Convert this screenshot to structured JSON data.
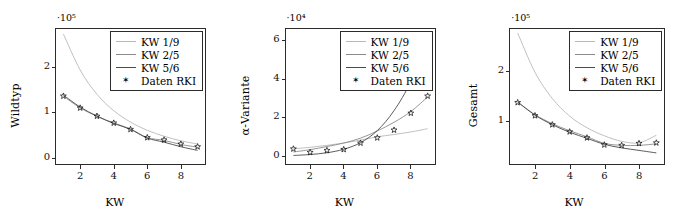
{
  "figure": {
    "panel_count": 3,
    "legend_entries": [
      {
        "label": "KW 1/9",
        "type": "line",
        "color": "#b9b9b9"
      },
      {
        "label": "KW 2/5",
        "type": "line",
        "color": "#8a8a8a"
      },
      {
        "label": "KW 5/6",
        "type": "line",
        "color": "#4a4a4a"
      },
      {
        "label": "Daten RKI",
        "type": "marker",
        "marker": "star-marker",
        "color": "#111111"
      }
    ]
  },
  "chart_data": [
    {
      "type": "line",
      "title": "",
      "xlabel": "KW",
      "ylabel": "Wildtyp",
      "y_exponent_label": "·10⁵",
      "y_exponent": 100000,
      "xlim": [
        0.5,
        9.5
      ],
      "ylim": [
        -0.15,
        2.85
      ],
      "xticks": [
        2,
        4,
        6,
        8
      ],
      "yticks": [
        0,
        1,
        2
      ],
      "grid": false,
      "legend_position": "top-right",
      "x": [
        1,
        2,
        3,
        4,
        5,
        6,
        7,
        8,
        9
      ],
      "series": [
        {
          "name": "KW 1/9",
          "color": "#b9b9b9",
          "values": [
            2.72,
            1.93,
            1.4,
            1.04,
            0.79,
            0.61,
            0.48,
            0.38,
            0.31
          ]
        },
        {
          "name": "KW 2/5",
          "color": "#8a8a8a",
          "values": [
            1.36,
            1.1,
            0.92,
            0.77,
            0.64,
            0.45,
            0.39,
            0.3,
            0.24
          ]
        },
        {
          "name": "KW 5/6",
          "color": "#4a4a4a",
          "values": [
            1.38,
            1.12,
            0.92,
            0.76,
            0.63,
            0.44,
            0.35,
            0.25,
            0.17
          ]
        }
      ],
      "markers": {
        "name": "Daten RKI",
        "x": [
          1,
          2,
          3,
          4,
          5,
          6,
          7,
          8,
          9
        ],
        "values": [
          1.36,
          1.1,
          0.92,
          0.77,
          0.63,
          0.45,
          0.4,
          0.31,
          0.25
        ]
      }
    },
    {
      "type": "line",
      "title": "",
      "xlabel": "KW",
      "ylabel": "α-Variante",
      "y_exponent_label": "·10⁴",
      "y_exponent": 10000,
      "xlim": [
        0.5,
        9.5
      ],
      "ylim": [
        -0.45,
        6.6
      ],
      "xticks": [
        2,
        4,
        6,
        8
      ],
      "yticks": [
        0,
        2,
        4,
        6
      ],
      "grid": false,
      "legend_position": "top-right",
      "x": [
        1,
        2,
        3,
        4,
        5,
        6,
        7,
        8,
        9
      ],
      "series": [
        {
          "name": "KW 1/9",
          "color": "#b9b9b9",
          "values": [
            0.38,
            0.46,
            0.56,
            0.68,
            0.83,
            1.0,
            1.12,
            1.25,
            1.42
          ]
        },
        {
          "name": "KW 2/5",
          "color": "#8a8a8a",
          "values": [
            0.22,
            0.34,
            0.5,
            0.68,
            0.93,
            1.3,
            1.75,
            2.3,
            3.05
          ]
        },
        {
          "name": "KW 5/6",
          "color": "#4a4a4a",
          "values": [
            0.04,
            0.09,
            0.18,
            0.36,
            0.7,
            1.32,
            2.35,
            3.85,
            6.05
          ]
        }
      ],
      "markers": {
        "name": "Daten RKI",
        "x": [
          1,
          2,
          3,
          4,
          5,
          6,
          7,
          8,
          9
        ],
        "values": [
          0.38,
          0.2,
          0.3,
          0.35,
          0.68,
          0.95,
          1.35,
          2.22,
          3.1
        ]
      }
    },
    {
      "type": "line",
      "title": "",
      "xlabel": "KW",
      "ylabel": "Gesamt",
      "y_exponent_label": "·10⁵",
      "y_exponent": 100000,
      "xlim": [
        0.5,
        9.5
      ],
      "ylim": [
        0.13,
        2.85
      ],
      "xticks": [
        2,
        4,
        6,
        8
      ],
      "yticks": [
        1,
        2
      ],
      "grid": false,
      "legend_position": "top-right",
      "x": [
        1,
        2,
        3,
        4,
        5,
        6,
        7,
        8,
        9
      ],
      "series": [
        {
          "name": "KW 1/9",
          "color": "#b9b9b9",
          "values": [
            2.75,
            1.97,
            1.45,
            1.1,
            0.87,
            0.71,
            0.6,
            0.57,
            0.72
          ]
        },
        {
          "name": "KW 2/5",
          "color": "#8a8a8a",
          "values": [
            1.38,
            1.13,
            0.95,
            0.81,
            0.69,
            0.56,
            0.52,
            0.52,
            0.55
          ]
        },
        {
          "name": "KW 5/6",
          "color": "#4a4a4a",
          "values": [
            1.38,
            1.12,
            0.93,
            0.78,
            0.66,
            0.54,
            0.47,
            0.42,
            0.37
          ]
        }
      ],
      "markers": {
        "name": "Daten RKI",
        "x": [
          1,
          2,
          3,
          4,
          5,
          6,
          7,
          8,
          9
        ],
        "values": [
          1.37,
          1.11,
          0.93,
          0.79,
          0.67,
          0.53,
          0.52,
          0.56,
          0.57
        ]
      }
    }
  ]
}
